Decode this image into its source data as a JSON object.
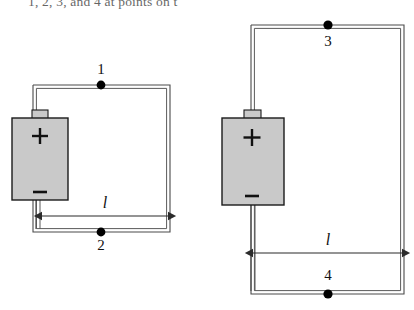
{
  "figure": {
    "caption_fragment": "1, 2, 3, and 4 at points on t",
    "colors": {
      "wire": "#3a3a3a",
      "battery_fill": "#c9c9c9",
      "battery_stroke": "#1a1a1a",
      "node": "#000000",
      "text": "#111111"
    },
    "circuits": [
      {
        "name": "left-circuit",
        "loop": {
          "x": 33,
          "y": 85,
          "width": 137,
          "height": 147
        },
        "battery": {
          "x": 12,
          "y": 118,
          "width": 56,
          "height": 82,
          "plus_label": "+",
          "minus_label": "−",
          "terminal_nub": {
            "x": 32,
            "y": 110,
            "width": 16,
            "height": 9
          }
        },
        "nodes": [
          {
            "label": "1",
            "cx": 101,
            "cy": 85,
            "label_x": 101,
            "label_y": 65
          },
          {
            "label": "2",
            "cx": 101,
            "cy": 232,
            "label_x": 101,
            "label_y": 238
          }
        ],
        "dimension": {
          "label": "l",
          "y": 216,
          "x1": 42,
          "x2": 168,
          "label_x": 105,
          "label_y": 196
        }
      },
      {
        "name": "right-circuit",
        "loop": {
          "x": 251,
          "y": 25,
          "width": 153,
          "height": 269
        },
        "battery": {
          "x": 222,
          "y": 118,
          "width": 62,
          "height": 87,
          "plus_label": "+",
          "minus_label": "−",
          "terminal_nub": {
            "x": 244,
            "y": 110,
            "width": 16,
            "height": 9
          }
        },
        "nodes": [
          {
            "label": "3",
            "cx": 328,
            "cy": 25,
            "label_x": 328,
            "label_y": 35
          },
          {
            "label": "4",
            "cx": 328,
            "cy": 294,
            "label_x": 328,
            "label_y": 268
          }
        ],
        "dimension": {
          "label": "l",
          "y": 253,
          "x1": 253,
          "x2": 402,
          "label_x": 328,
          "label_y": 233
        }
      }
    ]
  }
}
